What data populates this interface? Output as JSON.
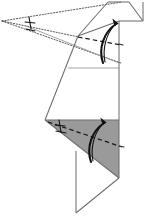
{
  "figure": {
    "title": "Origami folding step diagram",
    "width": 149,
    "height": 218,
    "background_color": "#ffffff"
  },
  "colors": {
    "paper_front": "#ffffff",
    "paper_back_shaded": "#9a9a9a",
    "edge_stroke": "#6e6e6e",
    "edge_stroke_dark": "#3a3a3a",
    "fold_dashed": "#1a1a1a",
    "projection_dotted": "#4a4a4a",
    "arrow_fill": "#111111",
    "tick_mark": "#111111"
  },
  "chart_data": {
    "type": "diagram",
    "title": "Origami folding step diagram",
    "xlabel": "",
    "ylabel": "",
    "xlim": [
      0,
      149
    ],
    "ylim": [
      0,
      218
    ],
    "grid": false,
    "legend": "none",
    "annotations": [
      "vanishing point at left edge",
      "two curved valley-fold arrows pointing up",
      "angle tick marks on upper and lower fold lines",
      "shaded triangle denotes reverse side of paper"
    ],
    "shapes": [
      {
        "name": "shaded-back-triangle",
        "kind": "polygon",
        "fill": "#9a9a9a",
        "points": "45,120 118,120 118,177 118,177"
      },
      {
        "name": "upper-white-body",
        "kind": "polygon",
        "fill": "#ffffff",
        "points": "78,37 118,22 118,120 45,120"
      },
      {
        "name": "lower-white-triangle",
        "kind": "polygon",
        "fill": "#ffffff",
        "points": "76,151 118,177 76,213"
      },
      {
        "name": "top-small-flap",
        "kind": "polygon",
        "fill": "#ffffff",
        "points": "118,22 128,2 143,2 143,22"
      }
    ],
    "lines": [
      {
        "name": "projection-upper",
        "style": "dotted",
        "from": [
          2,
          21
        ],
        "to": [
          119,
          2
        ]
      },
      {
        "name": "projection-middle",
        "style": "dotted",
        "from": [
          2,
          21
        ],
        "to": [
          78,
          37
        ]
      },
      {
        "name": "projection-lower",
        "style": "dotted",
        "from": [
          2,
          21
        ],
        "to": [
          119,
          62
        ]
      },
      {
        "name": "fold-dashed-upper",
        "style": "dashed",
        "from": [
          78,
          37
        ],
        "to": [
          119,
          44
        ]
      },
      {
        "name": "fold-dashed-lower",
        "style": "dashed",
        "from": [
          48,
          122
        ],
        "to": [
          119,
          146
        ]
      }
    ],
    "arrows": [
      {
        "name": "upper-fold-arrow",
        "direction": "up",
        "tip": [
          120,
          22
        ],
        "tail": [
          104,
          63
        ]
      },
      {
        "name": "lower-fold-arrow",
        "direction": "up",
        "tip": [
          108,
          121
        ],
        "tail": [
          92,
          162
        ]
      }
    ],
    "tick_marks": [
      {
        "name": "upper-angle-tick",
        "at": [
          31,
          23
        ],
        "count": 2
      },
      {
        "name": "lower-angle-tick",
        "at": [
          60,
          126
        ],
        "count": 2
      }
    ]
  }
}
